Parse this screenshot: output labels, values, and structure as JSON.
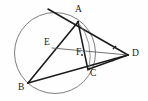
{
  "figure": {
    "kind": "euclidean-geometry-diagram",
    "width": 148,
    "height": 101,
    "background_color": "#fefefe",
    "stroke_color": "#1b1b1b",
    "thin_stroke_color": "#5a5a5a",
    "circle_stroke_color": "#6e6e6e",
    "label_color": "#1b1b1b"
  },
  "circle": {
    "name": "circumcircle",
    "cx": 55,
    "cy": 53,
    "r": 40.5,
    "stroke_width": 0.9
  },
  "points": {
    "A": {
      "label": "A",
      "x": 78,
      "y": 22,
      "label_x": 76,
      "label_y": 6
    },
    "B": {
      "label": "B",
      "x": 28,
      "y": 83,
      "label_x": 19,
      "label_y": 84
    },
    "C": {
      "label": "C",
      "x": 90,
      "y": 69,
      "label_x": 90,
      "label_y": 70
    },
    "D": {
      "label": "D",
      "x": 128,
      "y": 55,
      "label_x": 132,
      "label_y": 50
    },
    "E": {
      "label": "E",
      "x": 52,
      "y": 48,
      "label_x": 44,
      "label_y": 39
    },
    "F": {
      "label": "F",
      "x": 82,
      "y": 55,
      "label_x": 77,
      "label_y": 49
    }
  },
  "segments": [
    {
      "name": "tangent-at-A",
      "from": "T1",
      "to": "D",
      "x1": 48,
      "y1": 9,
      "x2": 128,
      "y2": 55,
      "weight": "thick"
    },
    {
      "name": "chord-AB",
      "from": "A",
      "to": "B",
      "x1": 78,
      "y1": 22,
      "x2": 28,
      "y2": 83,
      "weight": "thick"
    },
    {
      "name": "segment-A-to-C-through-F",
      "from": "A",
      "to": "C",
      "x1": 78,
      "y1": 22,
      "x2": 90,
      "y2": 69,
      "weight": "thick"
    },
    {
      "name": "secant-B-C-to-D",
      "from": "B",
      "to": "D",
      "x1": 28,
      "y1": 83,
      "x2": 128,
      "y2": 55,
      "weight": "thick"
    },
    {
      "name": "segment-A-to-F",
      "from": "A",
      "to": "F",
      "x1": 78,
      "y1": 22,
      "x2": 82,
      "y2": 55,
      "weight": "thick"
    },
    {
      "name": "segment-E-F-D",
      "from": "E",
      "to": "D",
      "x1": 52,
      "y1": 48,
      "x2": 128,
      "y2": 55,
      "weight": "thin"
    },
    {
      "name": "segment-E-to-A",
      "from": "E",
      "to": "A",
      "x1": 52,
      "y1": 48,
      "x2": 78,
      "y2": 22,
      "weight": "thin"
    },
    {
      "name": "chord-C-to-A-arc-side",
      "from": "C",
      "to": "A",
      "x1": 90,
      "y1": 69,
      "x2": 78,
      "y2": 22,
      "weight": "thin"
    },
    {
      "name": "segment-C-to-D",
      "from": "C",
      "to": "D",
      "x1": 90,
      "y1": 69,
      "x2": 128,
      "y2": 55,
      "weight": "thick"
    }
  ],
  "arcs": [
    {
      "name": "arc-A-to-C-inner",
      "d": "M 78 22 Q 95 40 90 69",
      "weight": "thin"
    }
  ],
  "angle_marks": {
    "name": "equal-angle-ticks-at-D",
    "description": "two pairs of dots marking congruent angles at D",
    "marks": [
      {
        "cx": 113,
        "cy": 49,
        "r": 0.8
      },
      {
        "cx": 115,
        "cy": 47,
        "r": 0.8
      },
      {
        "cx": 112,
        "cy": 60,
        "r": 0.8
      },
      {
        "cx": 114,
        "cy": 58,
        "r": 0.8
      }
    ]
  }
}
